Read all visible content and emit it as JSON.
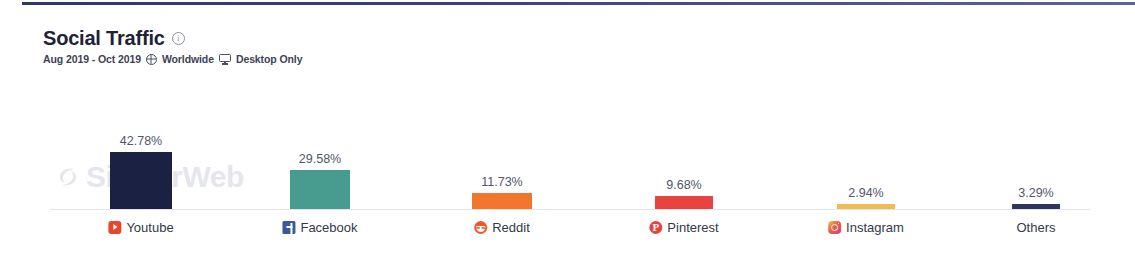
{
  "header": {
    "title": "Social Traffic",
    "info_icon": "info-icon",
    "date_range": "Aug 2019 - Oct 2019",
    "globe_icon": "globe-icon",
    "region": "Worldwide",
    "device_icon": "monitor-icon",
    "device": "Desktop Only"
  },
  "watermark": {
    "text": "SimilarWeb",
    "logo_icon": "similarweb-logo-icon"
  },
  "chart_data": {
    "type": "bar",
    "title": "Social Traffic",
    "subtitle": "Aug 2019 - Oct 2019 Worldwide Desktop Only",
    "xlabel": "",
    "ylabel": "",
    "ylim": [
      0,
      42.78
    ],
    "grid": false,
    "legend": "none",
    "unit": "%",
    "categories": [
      "Youtube",
      "Facebook",
      "Reddit",
      "Pinterest",
      "Instagram",
      "Others"
    ],
    "values": [
      42.78,
      29.58,
      11.73,
      9.68,
      2.94,
      3.29
    ],
    "value_labels": [
      "42.78%",
      "29.58%",
      "11.73%",
      "9.68%",
      "2.94%",
      "3.29%"
    ],
    "colors": [
      "#1b2142",
      "#479b8f",
      "#f2762e",
      "#e8433f",
      "#efbb52",
      "#2d3561"
    ],
    "icons": [
      "youtube-icon",
      "facebook-icon",
      "reddit-icon",
      "pinterest-icon",
      "instagram-icon",
      null
    ]
  }
}
